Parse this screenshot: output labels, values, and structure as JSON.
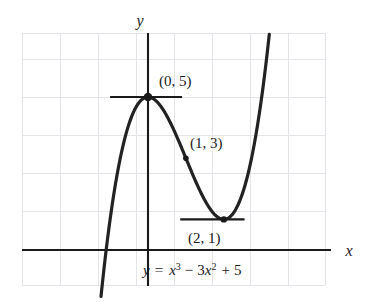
{
  "figure": {
    "kind": "cartesian-graph",
    "axis_labels": {
      "x": "x",
      "y": "y"
    },
    "equation": {
      "lhs": "y",
      "equals": "=",
      "term1_base": "x",
      "term1_exp": "3",
      "minus": "−",
      "term2_coeff": "3",
      "term2_base": "x",
      "term2_exp": "2",
      "plus": "+",
      "constant": "5",
      "plain": "y = x³ − 3x² + 5"
    },
    "annotations": [
      {
        "name": "local-maximum",
        "label": "(0, 5)",
        "x": 0,
        "y": 5
      },
      {
        "name": "inflection-point",
        "label": "(1, 3)",
        "x": 1,
        "y": 3
      },
      {
        "name": "local-minimum",
        "label": "(2, 1)",
        "x": 2,
        "y": 1
      }
    ],
    "colors": {
      "curve": "#1a1a1a",
      "axis": "#1a1a1a",
      "grid": "#e4e4e8",
      "text": "#1a1a1a",
      "background": "#ffffff"
    }
  },
  "chart_data": {
    "type": "line",
    "title": "",
    "subtitle": "",
    "xlabel": "x",
    "ylabel": "y",
    "grid": true,
    "legend": "none",
    "function": "y = x^3 - 3x^2 + 5",
    "xlim": [
      -3.3,
      4.7
    ],
    "ylim": [
      -2.2,
      6.1
    ],
    "x": [
      -1.4,
      -1.3,
      -1.2,
      -1.1,
      -1.0,
      -0.9,
      -0.8,
      -0.7,
      -0.6,
      -0.5,
      -0.4,
      -0.3,
      -0.2,
      -0.1,
      0.0,
      0.1,
      0.2,
      0.3,
      0.4,
      0.5,
      0.6,
      0.7,
      0.8,
      0.9,
      1.0,
      1.1,
      1.2,
      1.3,
      1.4,
      1.5,
      1.6,
      1.7,
      1.8,
      1.9,
      2.0,
      2.1,
      2.2,
      2.3,
      2.4,
      2.5,
      2.6,
      2.7,
      2.8,
      2.9,
      3.0,
      3.1,
      3.2,
      3.3
    ],
    "y": [
      -3.62,
      -2.27,
      -1.05,
      0.04,
      1.0,
      1.84,
      2.57,
      3.19,
      3.7,
      4.13,
      4.46,
      4.7,
      4.87,
      4.97,
      5.0,
      4.97,
      4.89,
      4.76,
      4.58,
      4.38,
      4.14,
      3.87,
      3.59,
      3.3,
      3.0,
      2.7,
      2.41,
      2.13,
      1.86,
      1.63,
      1.42,
      1.24,
      1.11,
      1.03,
      1.0,
      1.03,
      1.13,
      1.3,
      1.55,
      1.88,
      2.3,
      2.81,
      3.43,
      4.15,
      5.0,
      5.96,
      7.05,
      8.27
    ],
    "annotations": [
      {
        "label": "(0, 5)",
        "x": 0,
        "y": 5,
        "note": "local maximum, horizontal tangent"
      },
      {
        "label": "(1, 3)",
        "x": 1,
        "y": 3,
        "note": "point of inflection"
      },
      {
        "label": "(2, 1)",
        "x": 2,
        "y": 1,
        "note": "local minimum, horizontal tangent"
      }
    ],
    "markers": [
      {
        "x": 0,
        "y": 5,
        "size": "large"
      },
      {
        "x": 1,
        "y": 3,
        "size": "small"
      },
      {
        "x": 2,
        "y": 1,
        "size": "medium"
      }
    ],
    "tangent_lines": [
      {
        "at": "(0, 5)",
        "y": 5,
        "x_from": -1.0,
        "x_to": 0.9,
        "slope": 0
      },
      {
        "at": "(2, 1)",
        "y": 1,
        "x_from": 0.85,
        "x_to": 2.55,
        "slope": 0
      }
    ]
  }
}
